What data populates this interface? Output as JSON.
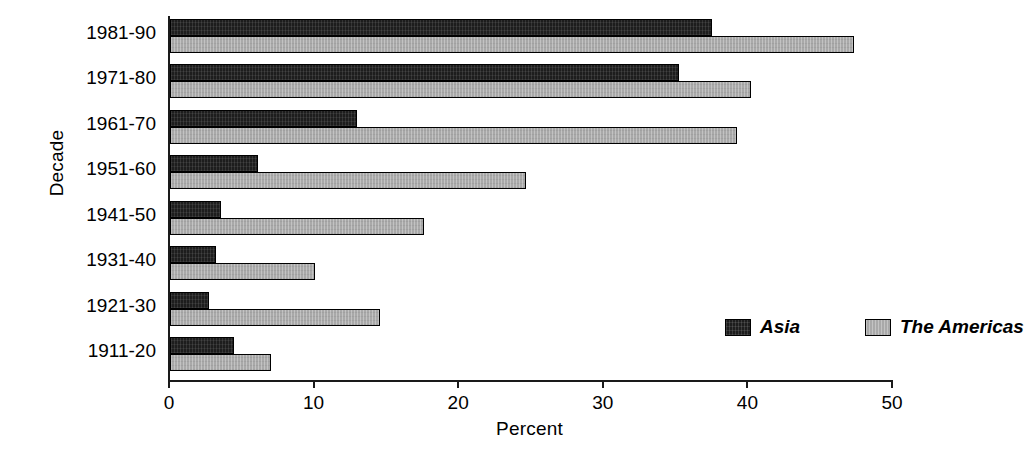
{
  "chart_data": {
    "type": "bar",
    "orientation": "horizontal",
    "title": "",
    "xlabel": "Percent",
    "ylabel": "Decade",
    "xlim": [
      0,
      50
    ],
    "xticks": [
      0,
      10,
      20,
      30,
      40,
      50
    ],
    "xtick_labels": [
      "0",
      "10",
      "20",
      "30",
      "40",
      "50"
    ],
    "grid": false,
    "legend_position": "inside-lower-right",
    "categories": [
      "1911-20",
      "1921-30",
      "1931-40",
      "1941-50",
      "1951-60",
      "1961-70",
      "1971-80",
      "1981-90"
    ],
    "categories_top_to_bottom": [
      "1981-90",
      "1971-80",
      "1961-70",
      "1951-60",
      "1941-50",
      "1931-40",
      "1921-30",
      "1911-20"
    ],
    "series": [
      {
        "name": "Asia",
        "color": "#1d1d1d",
        "values_top_to_bottom": [
          37.5,
          35.2,
          12.9,
          6.1,
          3.5,
          3.2,
          2.7,
          4.4
        ]
      },
      {
        "name": "The Americas",
        "color": "#a9a9a9",
        "values_top_to_bottom": [
          47.3,
          40.2,
          39.2,
          24.6,
          17.6,
          10.0,
          14.5,
          7.0
        ]
      }
    ]
  },
  "legend": {
    "entries": [
      {
        "label": "Asia",
        "swatch": "asia"
      },
      {
        "label": "The Americas",
        "swatch": "americas"
      }
    ]
  }
}
